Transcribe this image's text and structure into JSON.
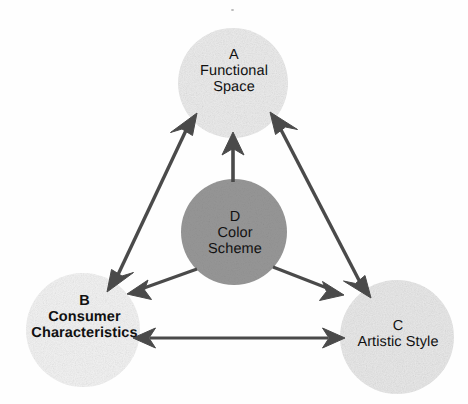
{
  "diagram": {
    "type": "relationship-triangle",
    "background_color": "#fefefe",
    "arrow_color": "#4a4a4a",
    "text_color": "#111111",
    "nodes": [
      {
        "id": "A",
        "letter": "A",
        "name_line1": "Functional",
        "name_line2": "Space",
        "full_name": "Functional Space",
        "fill_color": "#ebebeb",
        "cx": 233,
        "cy": 83,
        "r": 55,
        "bold": false
      },
      {
        "id": "B",
        "letter": "B",
        "name_line1": "Consumer",
        "name_line2": "Characteristics",
        "full_name": "Consumer Characteristics",
        "fill_color": "#f2f2f2",
        "cx": 83,
        "cy": 330,
        "r": 57,
        "bold": true
      },
      {
        "id": "C",
        "letter": "C",
        "name_line1": "Artistic Style",
        "name_line2": "",
        "full_name": "Artistic Style",
        "fill_color": "#e8e8e8",
        "cx": 397,
        "cy": 337,
        "r": 57,
        "bold": false
      },
      {
        "id": "D",
        "letter": "D",
        "name_line1": "Color",
        "name_line2": "Scheme",
        "full_name": "Color Scheme",
        "fill_color": "#979797",
        "cx": 234,
        "cy": 232,
        "r": 53,
        "bold": false
      }
    ],
    "edges": [
      {
        "id": "a-b",
        "from": "A",
        "to": "B",
        "heads": "double",
        "label": ""
      },
      {
        "id": "a-c",
        "from": "A",
        "to": "C",
        "heads": "double",
        "label": ""
      },
      {
        "id": "b-c",
        "from": "B",
        "to": "C",
        "heads": "double",
        "label": ""
      },
      {
        "id": "d-a",
        "from": "D",
        "to": "A",
        "heads": "single",
        "label": ""
      },
      {
        "id": "d-b",
        "from": "D",
        "to": "B",
        "heads": "single",
        "label": ""
      },
      {
        "id": "d-c",
        "from": "D",
        "to": "C",
        "heads": "single",
        "label": ""
      }
    ]
  }
}
